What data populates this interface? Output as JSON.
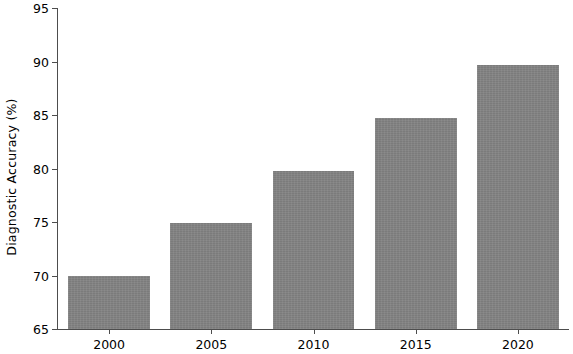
{
  "chart_data": {
    "type": "bar",
    "title": "",
    "subtitle": "",
    "xlabel": "",
    "ylabel": "Diagnostic Accuracy (%)",
    "categories": [
      "2000",
      "2005",
      "2010",
      "2015",
      "2020"
    ],
    "values": [
      70.0,
      74.9,
      79.8,
      84.7,
      89.7
    ],
    "series": [
      {
        "name": "Diagnostic Accuracy",
        "values": [
          70.0,
          74.9,
          79.8,
          84.7,
          89.7
        ]
      }
    ],
    "ylim": [
      65,
      95
    ],
    "xlim": [
      1997.5,
      2022.5
    ],
    "yticks": [
      65,
      70,
      75,
      80,
      85,
      90,
      95
    ],
    "ytick_labels": [
      "65",
      "70",
      "75",
      "80",
      "85",
      "90",
      "95"
    ],
    "xticks": [
      2000,
      2005,
      2010,
      2015,
      2020
    ],
    "xtick_labels": [
      "2000",
      "2005",
      "2010",
      "2015",
      "2020"
    ],
    "grid": false,
    "legend": null,
    "legend_position": "none",
    "annotations": [],
    "bar_color": "#828282",
    "axis_color": "#4d4d4d",
    "background_color": "#ffffff",
    "bar_width_ratio": 0.8
  }
}
